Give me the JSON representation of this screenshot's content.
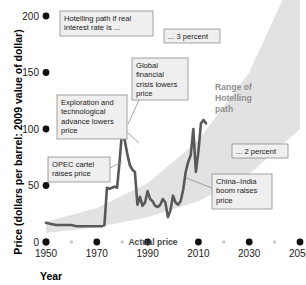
{
  "chart_data": {
    "type": "line",
    "title": "",
    "xlabel": "Year",
    "ylabel": "Price (dollars per barrel: 2009 value of dollar)",
    "xlim": [
      1950,
      2050
    ],
    "ylim": [
      0,
      200
    ],
    "xticks": [
      1950,
      1970,
      1990,
      2010,
      2030,
      2050
    ],
    "xticks_minor": [
      1960,
      1980,
      2000,
      2020,
      2040
    ],
    "yticks": [
      0,
      50,
      100,
      150,
      200
    ],
    "grid": false,
    "legend_position": "inline-annotations",
    "series": [
      {
        "name": "Actual price",
        "type": "line",
        "color": "#595959",
        "x": [
          1950,
          1952,
          1954,
          1956,
          1958,
          1960,
          1962,
          1964,
          1966,
          1968,
          1970,
          1972,
          1973,
          1974,
          1975,
          1976,
          1977,
          1978,
          1979,
          1980,
          1981,
          1982,
          1983,
          1984,
          1985,
          1986,
          1987,
          1988,
          1989,
          1990,
          1991,
          1992,
          1993,
          1994,
          1995,
          1996,
          1997,
          1998,
          1999,
          2000,
          2001,
          2002,
          2003,
          2004,
          2005,
          2006,
          2007,
          2008,
          2009,
          2010,
          2011,
          2012,
          2013
        ],
        "values": [
          17,
          16,
          15,
          15,
          15,
          15,
          14,
          14,
          14,
          14,
          14,
          14,
          15,
          48,
          47,
          48,
          49,
          48,
          72,
          100,
          90,
          78,
          68,
          64,
          62,
          33,
          40,
          32,
          35,
          45,
          38,
          36,
          32,
          31,
          33,
          38,
          35,
          22,
          28,
          41,
          35,
          33,
          36,
          46,
          62,
          71,
          77,
          100,
          62,
          80,
          105,
          108,
          105
        ]
      },
      {
        "name": "Range of Hotelling path",
        "type": "band",
        "color": "#e2e2e2",
        "x": [
          1950,
          1970,
          1990,
          2010,
          2030,
          2050
        ],
        "upper": [
          18,
          30,
          52,
          90,
          150,
          248
        ],
        "lower": [
          8,
          13,
          22,
          36,
          60,
          100
        ]
      }
    ],
    "annotations": [
      {
        "id": "hotelling-rate-note",
        "text": "Hotelling path if real interest rate is ...",
        "lines": [
          "Hotelling path if real",
          "interest rate is ..."
        ],
        "box": {
          "x": 60,
          "y": 11,
          "w": 93,
          "h": 25
        }
      },
      {
        "id": "three-percent",
        "text": "... 3 percent",
        "lines": [
          "... 3 percent"
        ],
        "box": {
          "x": 164,
          "y": 29,
          "w": 56,
          "h": 14
        }
      },
      {
        "id": "two-percent",
        "text": "... 2 percent",
        "lines": [
          "... 2 percent"
        ],
        "box": {
          "x": 232,
          "y": 144,
          "w": 56,
          "h": 14
        }
      },
      {
        "id": "global-financial-crisis",
        "text": "Global financial crisis lowers price",
        "lines": [
          "Global",
          "financial",
          "crisis lowers",
          "price"
        ],
        "box": {
          "x": 132,
          "y": 58,
          "w": 56,
          "h": 42
        },
        "leader": [
          [
            139,
            100
          ],
          [
            128,
            124
          ]
        ]
      },
      {
        "id": "exploration-technological-advance",
        "text": "Exploration and technological advance lowers price",
        "lines": [
          "Exploration and",
          "technological",
          "advance lowers",
          "price"
        ],
        "box": {
          "x": 57,
          "y": 95,
          "w": 70,
          "h": 44
        },
        "leader": [
          [
            127,
            132
          ],
          [
            139,
            143
          ]
        ]
      },
      {
        "id": "opec-cartel",
        "text": "OPEC cartel raises price",
        "lines": [
          "OPEC cartel",
          "raises price"
        ],
        "box": {
          "x": 48,
          "y": 157,
          "w": 62,
          "h": 25
        },
        "leader": [
          [
            110,
            168
          ],
          [
            122,
            162
          ]
        ]
      },
      {
        "id": "china-india-boom",
        "text": "China–India boom raises price",
        "lines": [
          "China–India",
          "boom raises",
          "price"
        ],
        "box": {
          "x": 212,
          "y": 174,
          "w": 60,
          "h": 35
        },
        "leader": [
          [
            212,
            188
          ],
          [
            186,
            178
          ]
        ]
      }
    ],
    "wedge_label": {
      "lines": [
        "Range of",
        "Hotelling",
        "path"
      ]
    },
    "series_label": "Actual price"
  },
  "colors": {
    "background": "#ffffff",
    "line": "#595959",
    "band": "#e2e2e2",
    "annotation_fill": "#efefef",
    "annotation_stroke": "#8c8c8c",
    "tick_major": "#111111",
    "tick_minor": "#c9c9c9",
    "text": "#1a1a1a",
    "wedge_text": "#8f8f8f"
  }
}
